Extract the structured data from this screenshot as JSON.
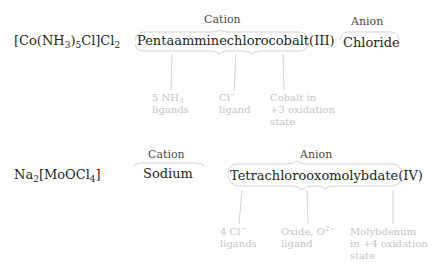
{
  "example1": {
    "formula": {
      "parts": [
        "[Co(NH",
        "3",
        ")",
        "5",
        "Cl]Cl",
        "2"
      ]
    },
    "cation_header": "Cation",
    "cation_name": "Pentaamminechlorocobalt(III)",
    "anion_header": "Anion",
    "anion_name": "Chloride",
    "notes": [
      {
        "line1_a": "5 NH",
        "line1_sub": "3",
        "line2": "ligands"
      },
      {
        "line1_a": "Cl",
        "line1_sup": "−",
        "line2": "ligand"
      },
      {
        "line1": "Cobalt in",
        "line2": "+3 oxidation",
        "line3": "state"
      }
    ]
  },
  "example2": {
    "formula": {
      "parts": [
        "Na",
        "2",
        "[MoOCl",
        "4",
        "]"
      ]
    },
    "cation_header": "Cation",
    "cation_name": "Sodium",
    "anion_header": "Anion",
    "anion_name": "Tetrachlorooxomolybdate(IV)",
    "notes": [
      {
        "line1_a": "4 Cl",
        "line1_sup": "−",
        "line2": "ligands"
      },
      {
        "line1_a": "Oxide, O",
        "line1_sup": "2−",
        "line2": "ligand"
      },
      {
        "line1": "Molybdenum",
        "line2": "in +4 oxidation",
        "line3": "state"
      }
    ]
  },
  "colors": {
    "text": "#231f20",
    "header": "#4a4a4a",
    "annotation": "#c4c4c4",
    "bracket": "#d0d0d0"
  }
}
